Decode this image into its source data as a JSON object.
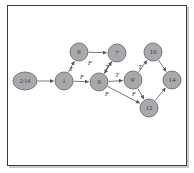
{
  "figure": {
    "background_color": "#ffffff",
    "frame_color": "#3b3b40",
    "node_fill": "#a9a9ad",
    "node_stroke": "#6e6e73",
    "edge_color": "#55555a",
    "label_color": "#3a3a3e"
  },
  "graph_data": {
    "type": "diagram",
    "layout": "directed-graph",
    "nodes": [
      {
        "id": "n214",
        "label": "2:14",
        "cx": 25,
        "cy": 81,
        "rx": 12,
        "ry": 9
      },
      {
        "id": "n1",
        "label": "1",
        "cx": 64,
        "cy": 81,
        "rx": 9,
        "ry": 9
      },
      {
        "id": "n6",
        "label": "6",
        "cx": 79,
        "cy": 52,
        "rx": 9,
        "ry": 9
      },
      {
        "id": "n7",
        "label": "7",
        "cx": 117,
        "cy": 53,
        "rx": 9,
        "ry": 9
      },
      {
        "id": "n9",
        "label": "9",
        "cx": 99,
        "cy": 82,
        "rx": 9,
        "ry": 9
      },
      {
        "id": "n9p",
        "label": "9'",
        "cx": 133,
        "cy": 80,
        "rx": 9,
        "ry": 9
      },
      {
        "id": "n10",
        "label": "10",
        "cx": 153,
        "cy": 52,
        "rx": 9,
        "ry": 9
      },
      {
        "id": "n14",
        "label": "14",
        "cx": 172,
        "cy": 80,
        "rx": 9,
        "ry": 9
      },
      {
        "id": "n12",
        "label": "12",
        "cx": 149,
        "cy": 108,
        "rx": 9,
        "ry": 9
      }
    ],
    "edges": [
      {
        "from": "n214",
        "to": "n1",
        "label": "",
        "lx": 0,
        "ly": 0
      },
      {
        "from": "n1",
        "to": "n6",
        "label": "T",
        "lx": 71,
        "ly": 70
      },
      {
        "from": "n6",
        "to": "n7",
        "label": "",
        "lx": 0,
        "ly": 0
      },
      {
        "from": "n7",
        "to": "n9",
        "label": "F",
        "lx": 90,
        "ly": 64
      },
      {
        "from": "n1",
        "to": "n9",
        "label": "F",
        "lx": 82,
        "ly": 78
      },
      {
        "from": "n9",
        "to": "n7",
        "label": "T",
        "lx": 107,
        "ly": 68
      },
      {
        "from": "n9",
        "to": "n9p",
        "label": "T",
        "lx": 117,
        "ly": 76
      },
      {
        "from": "n9",
        "to": "n12",
        "label": "F",
        "lx": 107,
        "ly": 95
      },
      {
        "from": "n9p",
        "to": "n10",
        "label": "T",
        "lx": 140,
        "ly": 68
      },
      {
        "from": "n10",
        "to": "n14",
        "label": "",
        "lx": 0,
        "ly": 0
      },
      {
        "from": "n9p",
        "to": "n12",
        "label": "F",
        "lx": 134,
        "ly": 95
      },
      {
        "from": "n12",
        "to": "n14",
        "label": "",
        "lx": 0,
        "ly": 0
      }
    ],
    "edge_label_legend": {
      "true_label": "T",
      "false_label": "F"
    }
  }
}
